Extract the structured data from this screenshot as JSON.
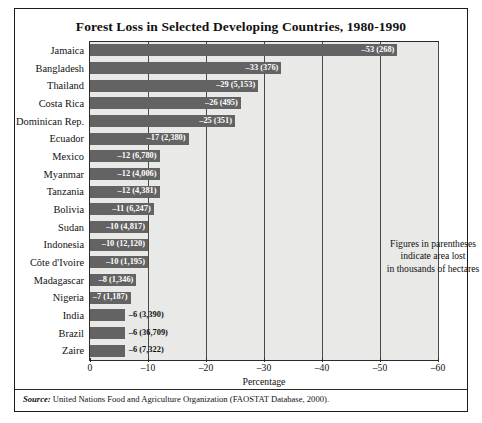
{
  "figure": {
    "title": "Forest Loss in Selected Developing Countries, 1980-1990",
    "annotation_line1": "Figures in parentheses",
    "annotation_line2": "indicate area lost",
    "annotation_line3": "in thousands of hectares",
    "source_prefix": "Source:",
    "source_text": " United Nations Food and Agriculture Organization (FAOSTAT Database, 2000).",
    "bar_color": "#636363",
    "plot_background": "#e9e9e7",
    "frame_color": "#1a1a1a"
  },
  "chart_data": {
    "type": "bar",
    "orientation": "horizontal",
    "title": "Forest Loss in Selected Developing Countries, 1980-1990",
    "xlabel": "Percentage",
    "ylabel": "",
    "xlim": [
      0,
      -60
    ],
    "xticks": [
      0,
      -10,
      -20,
      -30,
      -40,
      -50,
      -60
    ],
    "xtick_labels": [
      "0",
      "–10",
      "–20",
      "–30",
      "–40",
      "–50",
      "–60"
    ],
    "grid": true,
    "legend": null,
    "value_unit": "percent",
    "annotation": "Figures in parentheses indicate area lost in thousands of hectares",
    "categories": [
      "Jamaica",
      "Bangladesh",
      "Thailand",
      "Costa Rica",
      "Dominican Rep.",
      "Ecuador",
      "Mexico",
      "Myanmar",
      "Tanzania",
      "Bolivia",
      "Sudan",
      "Indonesia",
      "Côte d'Ivoire",
      "Madagascar",
      "Nigeria",
      "India",
      "Brazil",
      "Zaire"
    ],
    "values": [
      -53,
      -33,
      -29,
      -26,
      -25,
      -17,
      -12,
      -12,
      -12,
      -11,
      -10,
      -10,
      -10,
      -8,
      -7,
      -6,
      -6,
      -6
    ],
    "area_lost_thousand_hectares": [
      268,
      376,
      5153,
      495,
      351,
      2380,
      6780,
      4006,
      4381,
      6247,
      4817,
      12120,
      1195,
      1346,
      1187,
      3390,
      36709,
      7322
    ],
    "data_labels": [
      "–53 (268)",
      "–33 (376)",
      "–29 (5,153)",
      "–26 (495)",
      "–25 (351)",
      "–17 (2,380)",
      "–12 (6,780)",
      "–12 (4,006)",
      "–12 (4,381)",
      "–11 (6,247)",
      "–10 (4,817)",
      "–10 (12,120)",
      "–10 (1,195)",
      "–8 (1,346)",
      "–7 (1,187)",
      "–6 (3,390)",
      "–6 (36,709)",
      "–6 (7,322)"
    ],
    "label_placement": [
      "inside",
      "inside",
      "inside",
      "inside",
      "inside",
      "inside",
      "inside",
      "inside",
      "inside",
      "inside",
      "inside",
      "inside",
      "inside",
      "inside",
      "inside",
      "outside",
      "outside",
      "outside"
    ]
  }
}
